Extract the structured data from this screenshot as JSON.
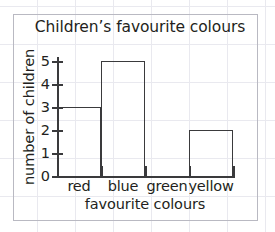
{
  "chart_data": {
    "type": "bar",
    "title": "Children’s favourite colours",
    "xlabel": "favourite colours",
    "ylabel": "number of children",
    "categories": [
      "red",
      "blue",
      "green",
      "yellow"
    ],
    "values": [
      3,
      5,
      0,
      2
    ],
    "ylim": [
      0,
      5
    ],
    "yticks": [
      0,
      1,
      2,
      3,
      4,
      5
    ],
    "ytick_labels": [
      "0",
      "1",
      "2",
      "3",
      "4",
      "5"
    ],
    "grid": true,
    "legend": null,
    "bar_style": "outline",
    "colors": {
      "bar_outline": "#3a3a3c",
      "axis": "#3a3a3c",
      "text": "#231f20",
      "paper_grid": "#e9e9ef",
      "frame": "#b9b9c2"
    }
  }
}
